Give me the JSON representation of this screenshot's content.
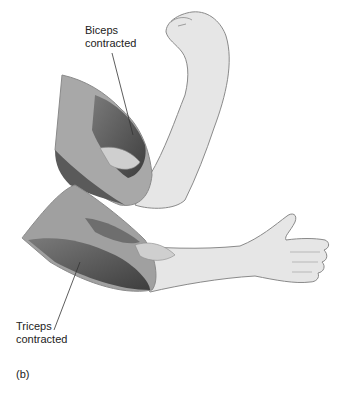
{
  "figure": {
    "panel_label": "(b)",
    "labels": {
      "biceps_line1": "Biceps",
      "biceps_line2": "contracted",
      "triceps_line1": "Triceps",
      "triceps_line2": "contracted"
    },
    "colors": {
      "skin": "#e6e6e6",
      "outline": "#8a8a8a",
      "muscle_dark": "#5a5a5a",
      "muscle_mid": "#9a9a9a",
      "text": "#222222"
    }
  }
}
